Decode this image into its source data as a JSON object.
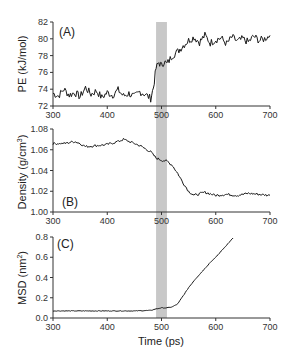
{
  "figure": {
    "shared_xlabel": "Time (ps)",
    "highlight_band": {
      "x_start": 490,
      "x_end": 510,
      "color": "#c8c8c8"
    }
  },
  "chart_data": [
    {
      "type": "line",
      "panel": "(A)",
      "title": "",
      "xlabel": "",
      "ylabel": "PE (kJ/mol)",
      "xlim": [
        300,
        700
      ],
      "ylim": [
        72,
        82
      ],
      "xticks": [
        300,
        400,
        500,
        600,
        700
      ],
      "yticks": [
        72,
        74,
        76,
        78,
        80,
        82
      ],
      "grid": false,
      "x": [
        300,
        310,
        320,
        330,
        340,
        350,
        360,
        370,
        380,
        390,
        400,
        410,
        420,
        430,
        440,
        450,
        460,
        470,
        480,
        485,
        490,
        495,
        500,
        505,
        510,
        520,
        530,
        540,
        550,
        560,
        570,
        580,
        590,
        600,
        610,
        620,
        630,
        640,
        650,
        660,
        670,
        680,
        690,
        700
      ],
      "series": [
        {
          "name": "PE",
          "values": [
            73.5,
            73.2,
            74.0,
            73.3,
            73.6,
            73.1,
            74.2,
            73.4,
            73.8,
            73.0,
            73.6,
            73.3,
            73.9,
            73.2,
            73.5,
            73.1,
            73.7,
            73.4,
            72.9,
            74.2,
            76.5,
            77.2,
            76.8,
            77.3,
            77.0,
            78.0,
            78.5,
            79.2,
            79.8,
            80.2,
            79.6,
            80.4,
            79.5,
            79.9,
            80.1,
            79.4,
            80.2,
            79.7,
            80.0,
            79.6,
            80.3,
            79.8,
            80.0,
            80.4
          ]
        }
      ]
    },
    {
      "type": "line",
      "panel": "(B)",
      "title": "",
      "xlabel": "",
      "ylabel": "Density (g/cm3)",
      "xlim": [
        300,
        700
      ],
      "ylim": [
        1.0,
        1.08
      ],
      "xticks": [
        300,
        400,
        500,
        600,
        700
      ],
      "yticks": [
        1.0,
        1.02,
        1.04,
        1.06,
        1.08
      ],
      "grid": false,
      "x": [
        300,
        320,
        340,
        350,
        360,
        380,
        400,
        420,
        430,
        440,
        450,
        460,
        470,
        480,
        490,
        500,
        510,
        520,
        530,
        540,
        550,
        560,
        580,
        600,
        620,
        640,
        660,
        680,
        700
      ],
      "series": [
        {
          "name": "Density",
          "values": [
            1.066,
            1.066,
            1.068,
            1.066,
            1.063,
            1.064,
            1.065,
            1.068,
            1.07,
            1.068,
            1.066,
            1.064,
            1.061,
            1.058,
            1.052,
            1.05,
            1.049,
            1.045,
            1.037,
            1.028,
            1.02,
            1.016,
            1.019,
            1.016,
            1.017,
            1.016,
            1.018,
            1.017,
            1.016
          ]
        }
      ]
    },
    {
      "type": "line",
      "panel": "(C)",
      "title": "",
      "xlabel": "Time (ps)",
      "ylabel": "MSD (nm2)",
      "xlim": [
        300,
        700
      ],
      "ylim": [
        0.0,
        0.8
      ],
      "xticks": [
        300,
        400,
        500,
        600,
        700
      ],
      "yticks": [
        0.0,
        0.2,
        0.4,
        0.6,
        0.8
      ],
      "grid": false,
      "x": [
        300,
        350,
        400,
        450,
        480,
        490,
        500,
        510,
        520,
        530,
        540,
        550,
        560,
        570,
        580,
        590,
        600,
        610,
        620,
        632
      ],
      "series": [
        {
          "name": "MSD",
          "values": [
            0.07,
            0.07,
            0.07,
            0.07,
            0.075,
            0.09,
            0.1,
            0.1,
            0.11,
            0.14,
            0.22,
            0.3,
            0.37,
            0.43,
            0.49,
            0.55,
            0.6,
            0.66,
            0.72,
            0.79
          ]
        }
      ]
    }
  ],
  "labels": {
    "panel_a": "(A)",
    "panel_b": "(B)",
    "panel_c": "(C)",
    "ylabel_a": "PE (kJ/mol)",
    "ylabel_b_main": "Density (g/cm",
    "ylabel_b_sup": "3",
    "ylabel_b_end": ")",
    "ylabel_c_main": "MSD (nm",
    "ylabel_c_sup": "2",
    "ylabel_c_end": ")",
    "xlabel": "Time (ps)"
  }
}
